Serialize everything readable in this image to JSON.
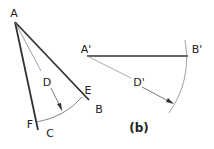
{
  "figure": {
    "left": {
      "labels": {
        "A": "A",
        "B": "B",
        "C": "C",
        "D": "D",
        "E": "E",
        "F": "F"
      }
    },
    "right": {
      "labels": {
        "A_prime": "A'",
        "B_prime": "B'",
        "D_prime": "D'"
      },
      "caption": "(b)"
    },
    "colors": {
      "line": "#333333",
      "thin_line": "#666666",
      "background": "#ffffff"
    }
  }
}
